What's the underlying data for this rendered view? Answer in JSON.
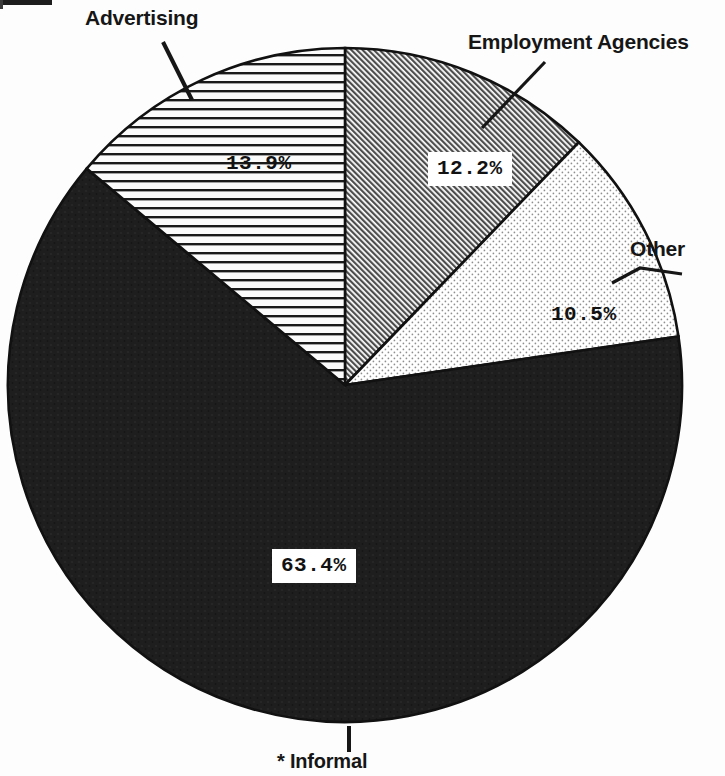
{
  "chart_data": {
    "type": "pie",
    "title": "",
    "categories": [
      "Employment Agencies",
      "Other",
      "* Informal",
      "Advertising"
    ],
    "values": [
      12.2,
      10.5,
      63.4,
      13.9
    ],
    "labels": [
      "12.2%",
      "10.5%",
      "63.4%",
      "13.9%"
    ],
    "units": "percent",
    "start_angle_deg": 0,
    "direction": "clockwise",
    "legend": "none",
    "grid": false,
    "slices": [
      {
        "name": "Employment Agencies",
        "value": 12.2,
        "value_label": "12.2%",
        "fill_style": "diagonal-hatch",
        "fill_color": "#b9b9b9",
        "label_boxed": true,
        "start_deg": 0,
        "end_deg": 43.9
      },
      {
        "name": "Other",
        "value": 10.5,
        "value_label": "10.5%",
        "fill_style": "stipple-dots",
        "fill_color": "#e8e8e8",
        "label_boxed": false,
        "start_deg": 43.9,
        "end_deg": 81.7
      },
      {
        "name": "* Informal",
        "value": 63.4,
        "value_label": "63.4%",
        "fill_style": "solid-dark",
        "fill_color": "#1f1f1f",
        "label_boxed": true,
        "start_deg": 81.7,
        "end_deg": 310.0
      },
      {
        "name": "Advertising",
        "value": 13.9,
        "value_label": "13.9%",
        "fill_style": "horizontal-lines",
        "fill_color": "#f4f4f4",
        "label_boxed": false,
        "start_deg": 310.0,
        "end_deg": 360.0
      }
    ]
  },
  "labels": {
    "advertising": "Advertising",
    "employment_agencies": "Employment Agencies",
    "other": "Other",
    "informal": "* Informal"
  },
  "values": {
    "advertising": "13.9%",
    "employment_agencies": "12.2%",
    "other": "10.5%",
    "informal": "63.4%"
  },
  "colors": {
    "outline": "#111111",
    "informal_fill": "#1f1f1f",
    "employment_fill": "#b9b9b9",
    "other_fill": "#ececec",
    "advertising_fill": "#f6f6f6",
    "text": "#161616",
    "background": "#fdfdfd"
  }
}
